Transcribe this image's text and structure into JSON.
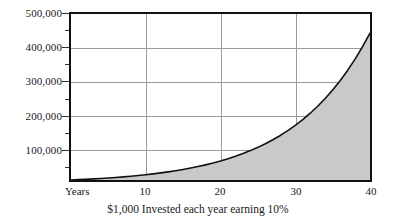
{
  "chart_data": {
    "type": "area",
    "title": "",
    "subtitle": "",
    "caption": "$1,000 Invested each year earning 10%",
    "xlabel": "Years",
    "ylabel": "",
    "xlim": [
      0,
      40
    ],
    "ylim": [
      0,
      500000
    ],
    "grid": true,
    "legend": null,
    "x_ticks": [
      {
        "value": 10,
        "label": "10"
      },
      {
        "value": 20,
        "label": "20"
      },
      {
        "value": 30,
        "label": "30"
      },
      {
        "value": 40,
        "label": "40"
      }
    ],
    "y_ticks": [
      {
        "value": 100000,
        "label": "100,000"
      },
      {
        "value": 200000,
        "label": "200,000"
      },
      {
        "value": 300000,
        "label": "300,000"
      },
      {
        "value": 400000,
        "label": "400,000"
      },
      {
        "value": 500000,
        "label": "500,000"
      }
    ],
    "y_minor_ticks": [
      50000,
      150000,
      250000,
      350000,
      450000
    ],
    "series": [
      {
        "name": "Future value of $1,000/year at 10%",
        "fill_color": "#c9c9c9",
        "line_color": "#111111",
        "x": [
          0,
          1,
          2,
          3,
          4,
          5,
          6,
          7,
          8,
          9,
          10,
          11,
          12,
          13,
          14,
          15,
          16,
          17,
          18,
          19,
          20,
          21,
          22,
          23,
          24,
          25,
          26,
          27,
          28,
          29,
          30,
          31,
          32,
          33,
          34,
          35,
          36,
          37,
          38,
          39,
          40
        ],
        "values": [
          0,
          1000,
          2100,
          3310,
          4641,
          6105,
          7716,
          9487,
          11436,
          13579,
          15937,
          18531,
          21384,
          24523,
          27975,
          31772,
          35950,
          40545,
          45599,
          51159,
          57275,
          64003,
          71403,
          79543,
          88497,
          98347,
          109182,
          121100,
          134210,
          148631,
          164494,
          181944,
          201138,
          222252,
          245477,
          271024,
          299127,
          330039,
          364043,
          401448,
          442593
        ]
      }
    ]
  },
  "axis": {
    "years_label": "Years"
  }
}
